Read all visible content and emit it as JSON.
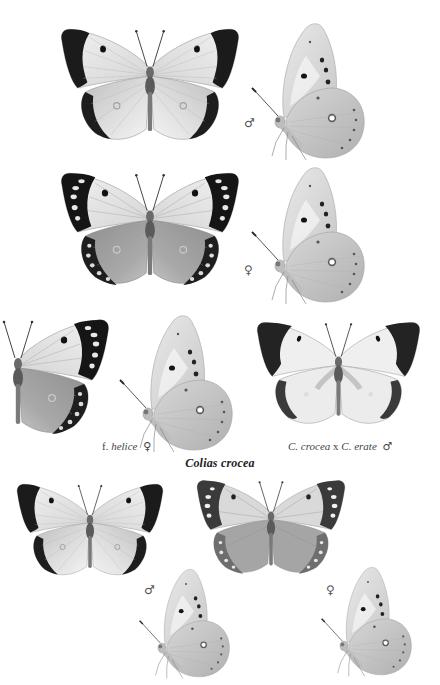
{
  "plate": {
    "species_title": "Colias crocea",
    "symbols": {
      "male": "♂",
      "female": "♀"
    },
    "figures": [
      {
        "id": "row1-upperside-male",
        "view": "upperside",
        "sex_symbol": "♂",
        "variant": "male"
      },
      {
        "id": "row1-underside-male",
        "view": "underside",
        "sex_symbol": "♂",
        "variant": "male"
      },
      {
        "id": "row2-upperside-female",
        "view": "upperside",
        "sex_symbol": "♀",
        "variant": "female"
      },
      {
        "id": "row2-underside-female",
        "view": "underside",
        "sex_symbol": "♀",
        "variant": "female"
      },
      {
        "id": "row3-helice-upperside",
        "view": "upperside-half",
        "variant": "helice"
      },
      {
        "id": "row3-helice-underside",
        "view": "underside",
        "variant": "helice"
      },
      {
        "id": "row3-hybrid-upperside",
        "view": "upperside",
        "variant": "hybrid"
      },
      {
        "id": "row4-upperside-male",
        "view": "upperside",
        "variant": "male"
      },
      {
        "id": "row4-upperside-female",
        "view": "upperside",
        "variant": "female-pale"
      },
      {
        "id": "row4-underside-male",
        "view": "underside",
        "sex_symbol": "♂",
        "variant": "male"
      },
      {
        "id": "row4-underside-female",
        "view": "underside",
        "sex_symbol": "♀",
        "variant": "female"
      }
    ],
    "captions": {
      "helice": {
        "prefix": "f.",
        "name": "helice",
        "sex_symbol": "♀"
      },
      "hybrid": {
        "name_a": "C. crocea",
        "separator": "x",
        "name_b": "C. erate",
        "sex_symbol": "♂"
      }
    },
    "colors": {
      "paper": "#ffffff",
      "wing_light": "#e6e6e6",
      "wing_mid": "#c9c9c9",
      "border_dark": "#1a1a1a",
      "ink": "#333333"
    }
  }
}
